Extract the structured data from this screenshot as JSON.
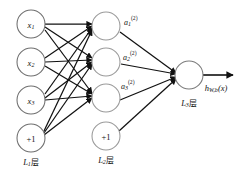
{
  "diagram": {
    "background_color": "#ffffff",
    "edge_color": "#111111",
    "node_stroke_color": "#7d7d7d",
    "node_fill_color": "#ffffff",
    "layers": [
      {
        "id": "L1",
        "label_base": "L",
        "label_sub": "1",
        "label_suffix": "层",
        "label_full": "L1层",
        "nodes": [
          {
            "id": "x1",
            "base": "x",
            "sub": "1",
            "sup": "",
            "text": "x1",
            "kind": "input"
          },
          {
            "id": "x2",
            "base": "x",
            "sub": "2",
            "sup": "",
            "text": "x2",
            "kind": "input"
          },
          {
            "id": "x3",
            "base": "x",
            "sub": "3",
            "sup": "",
            "text": "x3",
            "kind": "input"
          },
          {
            "id": "b1",
            "base": "+1",
            "sub": "",
            "sup": "",
            "text": "+1",
            "kind": "bias"
          }
        ]
      },
      {
        "id": "L2",
        "label_base": "L",
        "label_sub": "2",
        "label_suffix": "层",
        "label_full": "L2层",
        "nodes": [
          {
            "id": "h1",
            "base": "",
            "sub": "",
            "sup": "",
            "text": "",
            "kind": "hidden"
          },
          {
            "id": "h2",
            "base": "",
            "sub": "",
            "sup": "",
            "text": "",
            "kind": "hidden"
          },
          {
            "id": "h3",
            "base": "",
            "sub": "",
            "sup": "",
            "text": "",
            "kind": "hidden"
          },
          {
            "id": "b2",
            "base": "+1",
            "sub": "",
            "sup": "",
            "text": "+1",
            "kind": "bias"
          }
        ]
      },
      {
        "id": "L3",
        "label_base": "L",
        "label_sub": "3",
        "label_suffix": "层",
        "label_full": "L3层",
        "nodes": [
          {
            "id": "o1",
            "base": "",
            "sub": "",
            "sup": "",
            "text": "",
            "kind": "output"
          }
        ]
      }
    ],
    "activation_labels": [
      {
        "id": "a1",
        "base": "a",
        "sub": "1",
        "sup": "(2)",
        "text": "a1(2)"
      },
      {
        "id": "a2",
        "base": "a",
        "sub": "2",
        "sup": "(2)",
        "text": "a2(2)"
      },
      {
        "id": "a3",
        "base": "a",
        "sub": "3",
        "sup": "(2)",
        "text": "a3(2)"
      }
    ],
    "output": {
      "base": "h",
      "sub": "W,b",
      "arg": "(x)",
      "text": "hW,b(x)"
    },
    "connections": {
      "input_to_hidden": "full",
      "hidden_to_output": "full",
      "input_count": 4,
      "hidden_count": 4,
      "output_count": 1
    }
  }
}
